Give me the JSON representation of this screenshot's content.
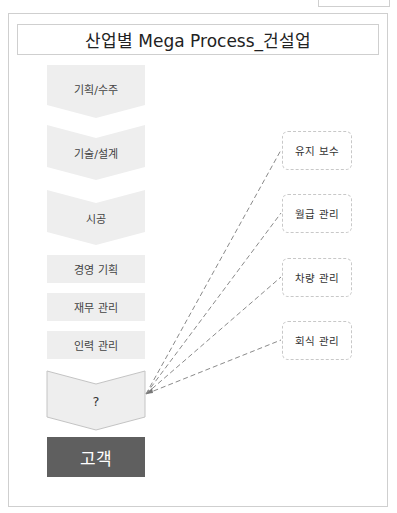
{
  "title": "산업별 Mega Process_건설업",
  "value_chain": [
    {
      "label": "기획/수주",
      "shape": "chevron-first"
    },
    {
      "label": "기술/설계",
      "shape": "chevron"
    },
    {
      "label": "시공",
      "shape": "chevron"
    }
  ],
  "support_functions": [
    {
      "label": "경영 기획"
    },
    {
      "label": "재무 관리"
    },
    {
      "label": "인력 관리"
    }
  ],
  "unknown_step": {
    "label": "?"
  },
  "customer": {
    "label": "고객"
  },
  "candidates": [
    {
      "label": "유지 보수"
    },
    {
      "label": "월급 관리"
    },
    {
      "label": "차량 관리"
    },
    {
      "label": "회식 관리"
    }
  ],
  "colors": {
    "chevron_fill": "#eeeeee",
    "customer_fill": "#5f5f5f",
    "border": "#cfcfcf",
    "dash_line": "#888888"
  }
}
